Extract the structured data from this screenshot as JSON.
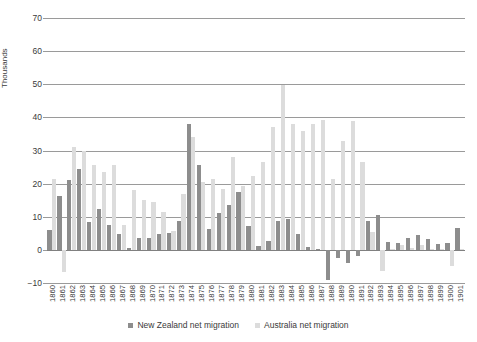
{
  "chart_data": {
    "type": "bar",
    "title": "",
    "xlabel": "",
    "ylabel": "Thousands",
    "ylim": [
      -10,
      70
    ],
    "ytick_step": 10,
    "yticks": [
      -10,
      0,
      10,
      20,
      30,
      40,
      50,
      60,
      70
    ],
    "grid": true,
    "legend_position": "bottom",
    "categories": [
      "1860",
      "1861",
      "1862",
      "1863",
      "1864",
      "1865",
      "1866",
      "1867",
      "1868",
      "1869",
      "1870",
      "1871",
      "1872",
      "1873",
      "1874",
      "1875",
      "1876",
      "1877",
      "1878",
      "1879",
      "1880",
      "1881",
      "1882",
      "1883",
      "1884",
      "1885",
      "1886",
      "1887",
      "1888",
      "1889",
      "1890",
      "1891",
      "1892",
      "1893",
      "1894",
      "1895",
      "1896",
      "1897",
      "1898",
      "1899",
      "1900",
      "1901"
    ],
    "series": [
      {
        "name": "New Zealand net migration",
        "color": "#8d8d8d",
        "values": [
          6,
          16.3,
          21,
          24.5,
          8.3,
          12.2,
          7.4,
          4.8,
          0.7,
          3.6,
          3.5,
          4.8,
          5,
          8.7,
          38,
          25.5,
          6.2,
          11.2,
          13.4,
          17.5,
          7.3,
          1.3,
          2.6,
          8.8,
          9.2,
          4.7,
          1,
          0.4,
          -9.1,
          -2.5,
          -4,
          -1.8,
          8.7,
          10.5,
          2.5,
          2,
          3.5,
          4.5,
          3.2,
          1.9,
          2,
          6.5
        ]
      },
      {
        "name": "Australia net migration",
        "color": "#dcdcdc",
        "values": [
          21.3,
          -6.8,
          31,
          30,
          25.5,
          23.5,
          25.5,
          7.5,
          18,
          15.2,
          14.5,
          11.5,
          5.7,
          16.8,
          34,
          20.4,
          21.5,
          18.5,
          28,
          19.3,
          22.2,
          26.5,
          37,
          49.8,
          38,
          36,
          38,
          39.2,
          21.5,
          33,
          39,
          26.5,
          5.5,
          -6.5,
          0.3,
          1.5,
          0.5,
          1.5,
          0.2,
          0.3,
          -4.8,
          0.4
        ]
      }
    ]
  },
  "legend": {
    "items": [
      {
        "label": "New Zealand net migration",
        "color": "#8d8d8d"
      },
      {
        "label": "Australia net migration",
        "color": "#dcdcdc"
      }
    ]
  }
}
